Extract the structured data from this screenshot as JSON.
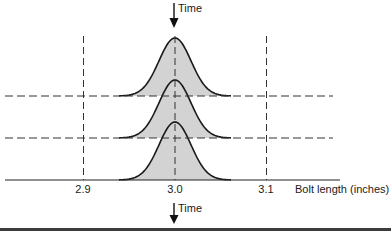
{
  "diagram": {
    "time_label_top": "Time",
    "time_label_bottom": "Time",
    "x_axis": {
      "label": "Bolt length (inches)",
      "ticks": [
        {
          "value": 2.9,
          "label": "2.9"
        },
        {
          "value": 3.0,
          "label": "3.0"
        },
        {
          "value": 3.1,
          "label": "3.1"
        }
      ]
    },
    "distributions": [
      {
        "name": "t1",
        "mean": 3.0,
        "level": 2
      },
      {
        "name": "t2",
        "mean": 3.0,
        "level": 1
      },
      {
        "name": "t3",
        "mean": 3.0,
        "level": 0
      }
    ],
    "colors": {
      "curve_fill": "#d3d3d3",
      "stroke": "#1a1a1a",
      "dash": "#333333",
      "bottom_bar": "#3c3c3c"
    }
  }
}
